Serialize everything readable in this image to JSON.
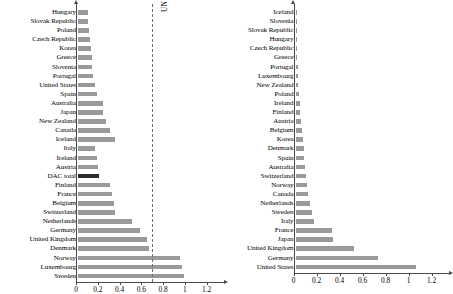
{
  "chart_data": [
    {
      "type": "bar",
      "title": "",
      "xlabel": "",
      "ylabel": "",
      "orientation": "horizontal",
      "xlim": [
        0,
        1.3
      ],
      "xticks": [
        0,
        0.2,
        0.4,
        0.6,
        0.8,
        1,
        1.2
      ],
      "xticklabels": [
        "0",
        "0.2",
        "0.4",
        "0.6",
        "0.8",
        "1",
        "1.2"
      ],
      "grid": false,
      "annotations": [
        {
          "text": "UN target 0.7%",
          "value": 0.7,
          "orientation": "vertical-dashed-line"
        }
      ],
      "highlight_category": "DAC total",
      "categories": [
        "Hungary",
        "Slovak Republic",
        "Poland",
        "Czech Republic",
        "Korea",
        "Greece",
        "Slovenia",
        "Portugal",
        "United States",
        "Spain",
        "Australia",
        "Japan",
        "New Zealand",
        "Canada",
        "Iceland",
        "Italy",
        "Ireland",
        "Austria",
        "DAC total",
        "Finland",
        "France",
        "Belgium",
        "Switzerland",
        "Netherlands",
        "Germany",
        "United Kingdom",
        "Denmark",
        "Norway",
        "Luxembourg",
        "Sweden"
      ],
      "values": [
        0.09,
        0.09,
        0.1,
        0.11,
        0.12,
        0.13,
        0.13,
        0.14,
        0.16,
        0.17,
        0.23,
        0.23,
        0.26,
        0.29,
        0.34,
        0.16,
        0.17,
        0.18,
        0.19,
        0.29,
        0.31,
        0.33,
        0.34,
        0.5,
        0.57,
        0.63,
        0.65,
        0.94,
        0.96,
        0.97
      ]
    },
    {
      "type": "bar",
      "title": "",
      "xlabel": "",
      "ylabel": "",
      "orientation": "horizontal",
      "xlim": [
        0,
        1.3
      ],
      "xticks": [
        0,
        0.2,
        0.4,
        0.6,
        0.8,
        1,
        1.2
      ],
      "xticklabels": [
        "0",
        "0.2",
        "0.4",
        "0.6",
        "0.8",
        "1",
        "1.2"
      ],
      "grid": false,
      "annotations": [],
      "highlight_category": "",
      "categories": [
        "Iceland",
        "Slovenia",
        "Slovak Republic",
        "Hungary",
        "Czech Republic",
        "Greece",
        "Portugal",
        "Luxembourg",
        "New Zealand",
        "Poland",
        "Ireland",
        "Finland",
        "Austria",
        "Belgium",
        "Korea",
        "Denmark",
        "Spain",
        "Australia",
        "Switzerland",
        "Norway",
        "Canada",
        "Netherlands",
        "Sweden",
        "Italy",
        "France",
        "Japan",
        "United Kingdom",
        "Germany",
        "United States"
      ],
      "values": [
        0.004,
        0.006,
        0.008,
        0.01,
        0.012,
        0.015,
        0.02,
        0.022,
        0.025,
        0.03,
        0.035,
        0.04,
        0.05,
        0.06,
        0.065,
        0.07,
        0.075,
        0.085,
        0.09,
        0.1,
        0.105,
        0.13,
        0.14,
        0.165,
        0.32,
        0.33,
        0.51,
        0.72,
        1.05
      ]
    }
  ]
}
